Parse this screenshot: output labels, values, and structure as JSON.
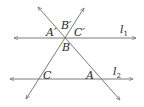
{
  "diagram": {
    "type": "geometry",
    "colors": {
      "line": "#6b6b6b",
      "text": "#2a2a2a",
      "background": "#ffffff"
    },
    "lines": {
      "l1": {
        "label": "l",
        "subscript": "1",
        "y": 38,
        "x1": 14,
        "x2": 136
      },
      "l2": {
        "label": "l",
        "subscript": "2",
        "y": 79,
        "x1": 10,
        "x2": 133
      },
      "transversal_1": {
        "x1": 38,
        "y1": 7,
        "x2": 120,
        "y2": 100
      },
      "transversal_2": {
        "x1": 84,
        "y1": 8,
        "x2": 26,
        "y2": 99
      }
    },
    "points": {
      "A_prime": {
        "label": "A′"
      },
      "B_prime": {
        "label": "B′"
      },
      "C_prime": {
        "label": "C′"
      },
      "B": {
        "label": "B"
      },
      "C": {
        "label": "C"
      },
      "A": {
        "label": "A"
      }
    }
  }
}
